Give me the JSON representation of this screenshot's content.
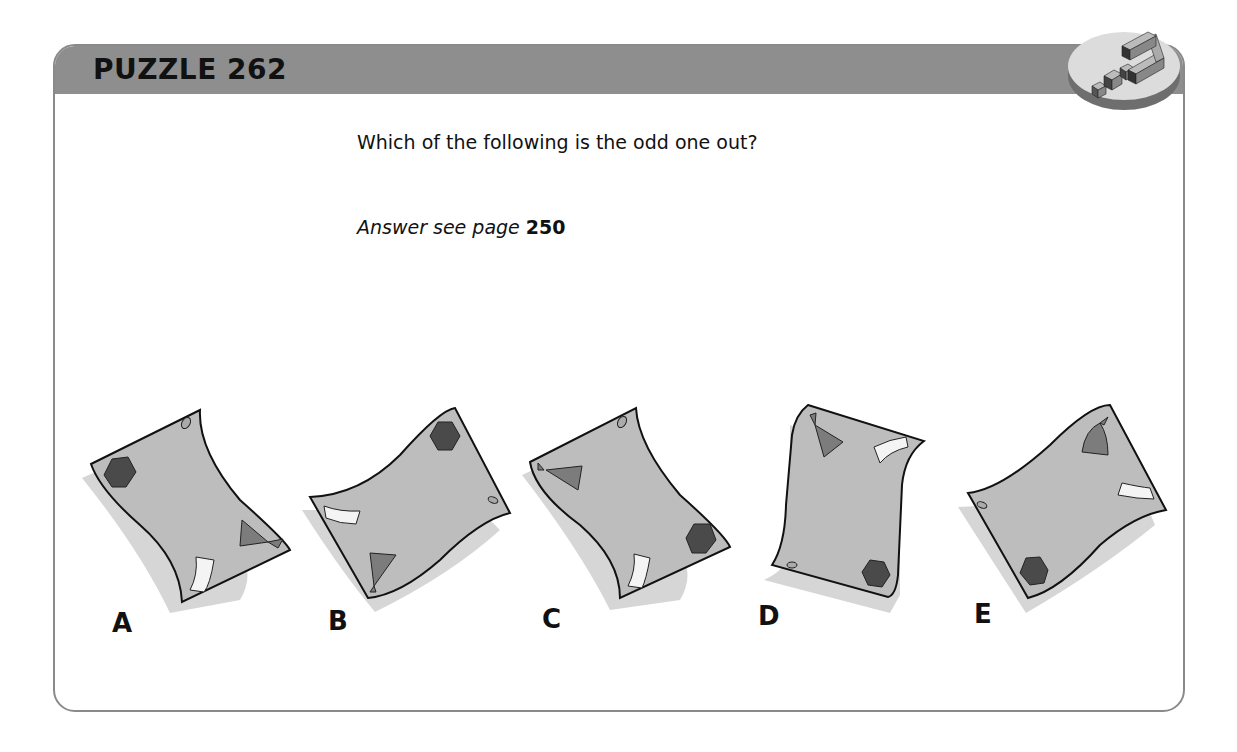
{
  "puzzle": {
    "title": "PUZZLE 262",
    "question": "Which of the following is the odd one out?",
    "answer_prefix": "Answer see page",
    "answer_page": "250"
  },
  "colors": {
    "header": "#8e8e8e",
    "paper": "#bdbdbd",
    "shadow": "#d6d6d6",
    "hexagon": "#4a4a4a",
    "triangle": "#7c7c7c",
    "strip": "#f4f4f4"
  },
  "options": [
    {
      "label": "A",
      "shapes": [
        "hexagon",
        "triangle",
        "white-strip",
        "hole"
      ]
    },
    {
      "label": "B",
      "shapes": [
        "hexagon",
        "triangle",
        "white-strip",
        "hole"
      ]
    },
    {
      "label": "C",
      "shapes": [
        "hexagon",
        "triangle",
        "white-strip",
        "hole"
      ]
    },
    {
      "label": "D",
      "shapes": [
        "hexagon",
        "triangle",
        "white-strip",
        "hole"
      ]
    },
    {
      "label": "E",
      "shapes": [
        "hexagon",
        "triangle",
        "white-strip",
        "hole"
      ]
    }
  ]
}
